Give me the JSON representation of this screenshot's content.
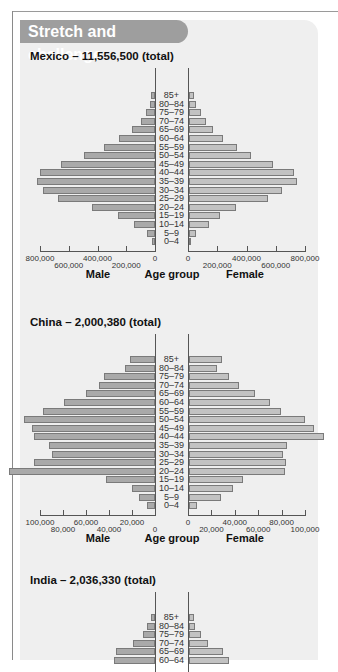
{
  "banner": {
    "title": "Stretch and challenge"
  },
  "axis_labels": {
    "male": "Male",
    "age_group": "Age group",
    "female": "Female"
  },
  "chart_data": [
    {
      "type": "bar",
      "subtype": "population-pyramid",
      "title": "Mexico – 11,556,500 (total)",
      "categories": [
        "85+",
        "80–84",
        "75–79",
        "70–74",
        "65–69",
        "60–64",
        "55–59",
        "50–54",
        "45–49",
        "40–44",
        "35–39",
        "30–34",
        "25–29",
        "20–24",
        "15–19",
        "10–14",
        "5–9",
        "0–4"
      ],
      "series": [
        {
          "name": "Male",
          "values": [
            28000,
            35000,
            63000,
            97000,
            160000,
            250000,
            355000,
            495000,
            655000,
            800000,
            820000,
            780000,
            675000,
            440000,
            255000,
            145000,
            55000,
            20000
          ]
        },
        {
          "name": "Female",
          "values": [
            35000,
            48000,
            82000,
            116000,
            164000,
            232000,
            328000,
            424000,
            574000,
            718000,
            738000,
            636000,
            540000,
            321000,
            212000,
            137000,
            48000,
            7000
          ]
        }
      ],
      "xlabel_left": "Male",
      "xlabel_center": "Age group",
      "xlabel_right": "Female",
      "xlim": [
        0,
        800000
      ],
      "ticks_left": [
        "800,000",
        "600,000",
        "400,000",
        "200,000",
        "0"
      ],
      "ticks_right": [
        "0",
        "200,000",
        "400,000",
        "600,000",
        "800,000"
      ],
      "grid": false,
      "legend": "none"
    },
    {
      "type": "bar",
      "subtype": "population-pyramid",
      "title": "China – 2,000,380 (total)",
      "categories": [
        "85+",
        "80–84",
        "75–79",
        "70–74",
        "65–69",
        "60–64",
        "55–59",
        "50–54",
        "45–49",
        "40–44",
        "35–39",
        "30–34",
        "25–29",
        "20–24",
        "15–19",
        "10–14",
        "5–9",
        "0–4"
      ],
      "series": [
        {
          "name": "Male",
          "values": [
            22000,
            26000,
            44000,
            49000,
            60000,
            79000,
            97000,
            114000,
            107000,
            105000,
            92000,
            90000,
            105000,
            127000,
            43000,
            20000,
            14000,
            7000
          ]
        },
        {
          "name": "Female",
          "values": [
            28000,
            24000,
            34000,
            43000,
            56000,
            69000,
            79000,
            99000,
            107000,
            115000,
            84000,
            80000,
            83000,
            82000,
            46000,
            38000,
            27000,
            7000
          ]
        }
      ],
      "xlabel_left": "Male",
      "xlabel_center": "Age group",
      "xlabel_right": "Female",
      "xlim": [
        0,
        100000
      ],
      "ticks_left": [
        "100,000",
        "80,000",
        "60,000",
        "40,000",
        "20,000",
        "0"
      ],
      "ticks_right": [
        "0",
        "20,000",
        "40,000",
        "60,000",
        "80,000",
        "100,000"
      ],
      "grid": false,
      "legend": "none"
    },
    {
      "type": "bar",
      "subtype": "population-pyramid",
      "title": "India – 2,036,330 (total)",
      "categories": [
        "85+",
        "80–84",
        "75–79",
        "70–74",
        "65–69",
        "60–64"
      ],
      "series": [
        {
          "name": "Male",
          "values": [
            4,
            8,
            12,
            22,
            39,
            41
          ]
        },
        {
          "name": "Female",
          "values": [
            5,
            6,
            12,
            19,
            34,
            40
          ]
        }
      ],
      "note": "partially visible; values are relative bar lengths in px"
    }
  ]
}
